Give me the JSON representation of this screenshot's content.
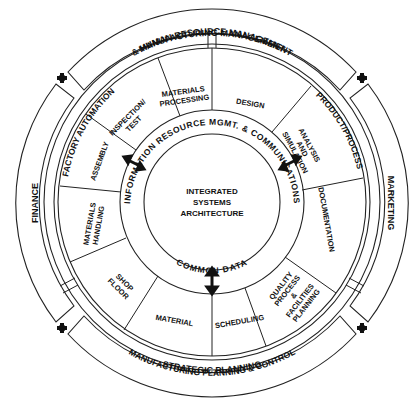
{
  "diagram": {
    "core": {
      "lines": [
        "INTEGRATED",
        "SYSTEMS",
        "ARCHITECTURE"
      ]
    },
    "info_ring": {
      "top_label": "INFORMATION RESOURCE MGMT. & COMMUNICATIONS",
      "bottom_label": "COMMON DATA"
    },
    "wedges": [
      {
        "id": "design",
        "lines": [
          "DESIGN"
        ]
      },
      {
        "id": "analysis",
        "lines": [
          "ANALYSIS",
          "AND",
          "SIMULATION"
        ]
      },
      {
        "id": "documentation",
        "lines": [
          "DOCUMENTATION"
        ]
      },
      {
        "id": "quality",
        "lines": [
          "QUALITY",
          "PROCESS",
          "&",
          "FACILITIES",
          "PLANNING"
        ]
      },
      {
        "id": "scheduling",
        "lines": [
          "SCHEDULING"
        ]
      },
      {
        "id": "material",
        "lines": [
          "MATERIAL"
        ]
      },
      {
        "id": "shop-floor",
        "lines": [
          "SHOP",
          "FLOOR"
        ]
      },
      {
        "id": "materials-handling",
        "lines": [
          "MATERIALS",
          "HANDLING"
        ]
      },
      {
        "id": "assembly",
        "lines": [
          "ASSEMBLY"
        ]
      },
      {
        "id": "inspection",
        "lines": [
          "INSPECTION/",
          "TEST"
        ]
      },
      {
        "id": "materials-processing",
        "lines": [
          "MATERIALS",
          "PROCESSING"
        ]
      }
    ],
    "inner_bands": {
      "factory_automation": "FACTORY AUTOMATION",
      "product_process": "PRODUCT/PROCESS",
      "mfg_planning": "MANUFACTURING PLANNING & CONTROL"
    },
    "outer_bands": {
      "top_line1": "MANUFACTURING MANAGEMENT",
      "top_line2": "& HUMAN RESOURCE MANAGEMENT",
      "marketing": "MARKETING",
      "strategic": "STRATEGIC PLANNING",
      "finance": "FINANCE"
    },
    "colors": {
      "line": "#222222",
      "text": "#111111",
      "background": "#ffffff"
    }
  }
}
